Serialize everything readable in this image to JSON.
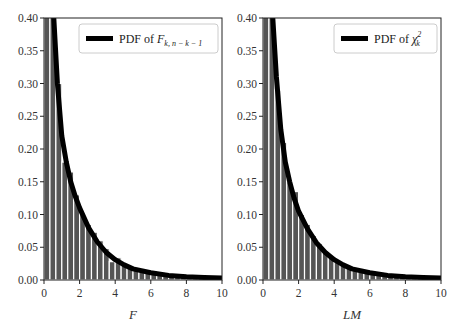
{
  "chart_data": [
    {
      "type": "bar",
      "panel": "left",
      "title": "",
      "xlabel": "F",
      "ylabel": "",
      "xlim": [
        0,
        10
      ],
      "ylim": [
        0,
        0.4
      ],
      "xticks": [
        "0",
        "2",
        "4",
        "6",
        "8",
        "10"
      ],
      "yticks": [
        "0.00",
        "0.05",
        "0.10",
        "0.15",
        "0.20",
        "0.25",
        "0.30",
        "0.35",
        "0.40"
      ],
      "grid": false,
      "legend": {
        "position": "upper right",
        "entries": [
          "PDF of F_{k,n-k-1}"
        ]
      },
      "bin_width": 0.333,
      "bin_starts": [
        0,
        0.333,
        0.667,
        1.0,
        1.333,
        1.667,
        2.0,
        2.333,
        2.667,
        3.0,
        3.333,
        3.667,
        4.0,
        4.333,
        4.667,
        5.0,
        5.333,
        5.667,
        6.0,
        6.333,
        6.667,
        7.0,
        7.333,
        7.667,
        8.0,
        8.333,
        8.667,
        9.0,
        9.333,
        9.667
      ],
      "histogram_values": [
        0.6,
        0.42,
        0.3,
        0.18,
        0.165,
        0.13,
        0.1,
        0.085,
        0.073,
        0.06,
        0.048,
        0.028,
        0.034,
        0.026,
        0.021,
        0.017,
        0.014,
        0.012,
        0.01,
        0.008,
        0.007,
        0.006,
        0.005,
        0.004,
        0.004,
        0.003,
        0.003,
        0.003,
        0.002,
        0.002
      ],
      "series": [
        {
          "name": "PDF of F_{k,n-k-1}",
          "type": "line",
          "x": [
            0.55,
            0.75,
            1.0,
            1.25,
            1.5,
            1.75,
            2.0,
            2.5,
            3.0,
            3.5,
            4.0,
            4.5,
            5.0,
            6.0,
            7.0,
            8.0,
            9.0,
            10.0
          ],
          "y": [
            0.4,
            0.3,
            0.22,
            0.18,
            0.15,
            0.128,
            0.11,
            0.08,
            0.058,
            0.042,
            0.031,
            0.023,
            0.017,
            0.011,
            0.007,
            0.005,
            0.004,
            0.003
          ]
        }
      ]
    },
    {
      "type": "bar",
      "panel": "right",
      "title": "",
      "xlabel": "LM",
      "ylabel": "",
      "xlim": [
        0,
        10
      ],
      "ylim": [
        0,
        0.4
      ],
      "xticks": [
        "0",
        "2",
        "4",
        "6",
        "8",
        "10"
      ],
      "yticks": [
        "0.00",
        "0.05",
        "0.10",
        "0.15",
        "0.20",
        "0.25",
        "0.30",
        "0.35",
        "0.40"
      ],
      "grid": false,
      "legend": {
        "position": "upper right",
        "entries": [
          "PDF of χ²_k"
        ]
      },
      "bin_width": 0.333,
      "bin_starts": [
        0,
        0.333,
        0.667,
        1.0,
        1.333,
        1.667,
        2.0,
        2.333,
        2.667,
        3.0,
        3.333,
        3.667,
        4.0,
        4.333,
        4.667,
        5.0,
        5.333,
        5.667,
        6.0,
        6.333,
        6.667,
        7.0,
        7.333,
        7.667,
        8.0,
        8.333,
        8.667,
        9.0,
        9.333,
        9.667
      ],
      "histogram_values": [
        0.6,
        0.42,
        0.29,
        0.21,
        0.15,
        0.135,
        0.1,
        0.085,
        0.068,
        0.056,
        0.045,
        0.036,
        0.03,
        0.024,
        0.019,
        0.016,
        0.013,
        0.011,
        0.009,
        0.007,
        0.006,
        0.005,
        0.004,
        0.004,
        0.003,
        0.003,
        0.003,
        0.002,
        0.002,
        0.002
      ],
      "series": [
        {
          "name": "PDF of χ²_k",
          "type": "line",
          "x": [
            0.55,
            0.75,
            1.0,
            1.25,
            1.5,
            1.75,
            2.0,
            2.5,
            3.0,
            3.5,
            4.0,
            4.5,
            5.0,
            6.0,
            7.0,
            8.0,
            9.0,
            10.0
          ],
          "y": [
            0.4,
            0.31,
            0.23,
            0.18,
            0.15,
            0.125,
            0.105,
            0.078,
            0.057,
            0.042,
            0.031,
            0.023,
            0.017,
            0.011,
            0.007,
            0.005,
            0.004,
            0.003
          ]
        }
      ]
    }
  ],
  "panels": [
    {
      "xlabel": "F",
      "legend_prefix": "PDF of ",
      "legend_symbol": "F",
      "legend_subscript": "k, n − k − 1",
      "legend_superscript": ""
    },
    {
      "xlabel": "LM",
      "legend_prefix": "PDF of ",
      "legend_symbol": "χ",
      "legend_subscript": "k",
      "legend_superscript": "2"
    }
  ],
  "colors": {
    "bar": "#555555",
    "bar_edge": "#ffffff",
    "curve": "#000000",
    "frame": "#222222"
  }
}
